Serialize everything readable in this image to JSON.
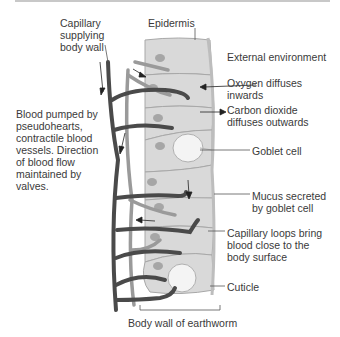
{
  "diagram": {
    "title": "Body wall of earthworm",
    "labels": {
      "capillary": "Capillary\nsupplying\nbody wall",
      "epidermis": "Epidermis",
      "external": "External environment",
      "oxygen": "Oxygen diffuses\ninwards",
      "co2": "Carbon dioxide\ndiffuses outwards",
      "goblet": "Goblet cell",
      "blood": "Blood pumped by\npseudohearts,\ncontractile blood\nvessels. Direction\nof blood flow\nmaintained by\nvalves.",
      "mucus": "Mucus secreted\nby goblet cell",
      "loops": "Capillary loops bring\nblood close to the\nbody surface",
      "cuticle": "Cuticle",
      "bodywall": "Body wall of earthworm"
    },
    "colors": {
      "cell_fill": "#d9d9d9",
      "cell_stroke": "#a8a8a8",
      "nucleus": "#a0a0a0",
      "vessel_dark": "#4a4a4a",
      "vessel_light": "#9a9a9a",
      "goblet_fill": "#f2f2f2"
    }
  }
}
